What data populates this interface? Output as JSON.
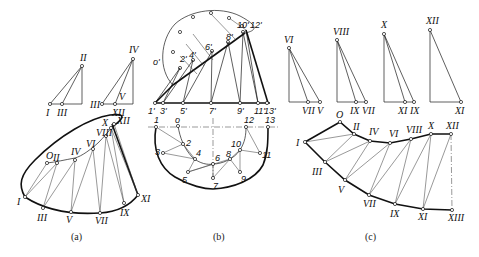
{
  "figure": {
    "captions": {
      "a": "(a)",
      "b": "(b)",
      "c": "(c)"
    },
    "panel_a": {
      "triangles": [
        {
          "apex": "II",
          "base": [
            "I",
            "III"
          ]
        },
        {
          "apex": "IV",
          "base": [
            "III",
            "V",
            "XII"
          ]
        }
      ],
      "top_labels": [
        "O",
        "II",
        "IV",
        "VI",
        "VIII",
        "X",
        "XII"
      ],
      "bottom_labels": [
        "I",
        "III",
        "V",
        "VII",
        "IX",
        "XI"
      ],
      "label_II": "II",
      "label_I": "I",
      "label_III": "III",
      "label_IV": "IV",
      "label_V": "V",
      "label_XII": "XII",
      "label_O": "O",
      "label_VI": "VI",
      "label_VIII": "VIII",
      "label_X": "X",
      "label_VII": "VII",
      "label_IX": "IX",
      "label_XI": "XI"
    },
    "panel_b": {
      "front_view_labels": [
        "o'",
        "2'",
        "4'",
        "6'",
        "8'",
        "10'",
        "12'"
      ],
      "base_labels": [
        "1'",
        "3'",
        "5'",
        "7'",
        "9'",
        "11'",
        "13'"
      ],
      "top_view_labels": [
        "1",
        "o",
        "2",
        "3",
        "4",
        "5",
        "6",
        "7",
        "8",
        "9",
        "10",
        "11",
        "12",
        "13"
      ],
      "o_prime": "o'",
      "p2": "2'",
      "p4": "4'",
      "p6": "6'",
      "p8": "8'",
      "p10": "10'",
      "p12": "12'",
      "b1": "1'",
      "b3": "3'",
      "b5": "5'",
      "b7": "7'",
      "b9": "9'",
      "b11": "11'",
      "b13": "13'",
      "t1": "1",
      "to": "o",
      "t2": "2",
      "t3": "3",
      "t4": "4",
      "t5": "5",
      "t6": "6",
      "t7": "7",
      "t8": "8",
      "t9": "9",
      "t10": "10",
      "t11": "11",
      "t12": "12",
      "t13": "13"
    },
    "panel_c": {
      "triangles": [
        {
          "apex": "VI",
          "base": [
            "VII",
            "V"
          ]
        },
        {
          "apex": "VIII",
          "base": [
            "IX",
            "VII"
          ]
        },
        {
          "apex": "X",
          "base": [
            "XI",
            "IX"
          ]
        },
        {
          "apex": "XII",
          "base": [
            "XI"
          ]
        }
      ],
      "development_top": [
        "I",
        "O",
        "II",
        "IV",
        "VI",
        "VIII",
        "X",
        "XII"
      ],
      "development_bottom": [
        "III",
        "V",
        "VII",
        "IX",
        "XI",
        "XIII"
      ],
      "tVI": "VI",
      "tVII": "VII",
      "tV": "V",
      "tVIII": "VIII",
      "tIX": "IX",
      "tVII2": "VII",
      "tX": "X",
      "tXI": "XI",
      "tIX2": "IX",
      "tXII": "XII",
      "tXI2": "XI",
      "dI": "I",
      "dO": "O",
      "dII": "II",
      "dIV": "IV",
      "dVI": "VI",
      "dVIII": "VIII",
      "dX": "X",
      "dXII": "XII",
      "dIII": "III",
      "dV": "V",
      "dVII": "VII",
      "dIX": "IX",
      "dXI": "XI",
      "dXIII": "XIII"
    }
  }
}
